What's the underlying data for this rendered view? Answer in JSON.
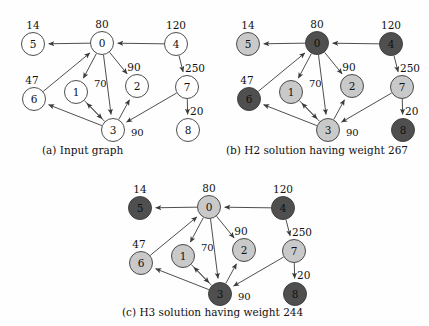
{
  "figure": {
    "background": "#fefefe",
    "stroke": "#3a3a3a",
    "fill_white": "#ffffff",
    "fill_light": "#c9c9c9",
    "fill_dark": "#4f4f4f"
  },
  "panels": [
    {
      "id": "a",
      "caption": "(a) Input graph",
      "nodes": [
        {
          "id": "5",
          "label": "5",
          "weight": "14",
          "shade": "white",
          "x": 33,
          "y": 42
        },
        {
          "id": "0",
          "label": "0",
          "weight": "80",
          "shade": "white",
          "x": 102,
          "y": 41
        },
        {
          "id": "4",
          "label": "4",
          "weight": "120",
          "shade": "white",
          "x": 176,
          "y": 42
        },
        {
          "id": "6",
          "label": "6",
          "weight": "47",
          "shade": "white",
          "x": 34,
          "y": 97
        },
        {
          "id": "1",
          "label": "1",
          "weight": "",
          "shade": "white",
          "x": 76,
          "y": 90
        },
        {
          "id": "2",
          "label": "2",
          "weight": "90",
          "shade": "white",
          "x": 137,
          "y": 84
        },
        {
          "id": "7",
          "label": "7",
          "weight": "250",
          "shade": "white",
          "x": 187,
          "y": 85
        },
        {
          "id": "3",
          "label": "3",
          "weight": "",
          "shade": "white",
          "x": 113,
          "y": 128
        },
        {
          "id": "8",
          "label": "8",
          "weight": "20",
          "shade": "white",
          "x": 188,
          "y": 128
        }
      ],
      "edge_labels": [
        {
          "text": "70",
          "x": 94,
          "y": 85
        },
        {
          "text": "90",
          "x": 131,
          "y": 134
        }
      ]
    },
    {
      "id": "b",
      "caption": "(b) H2 solution having weight 267",
      "nodes": [
        {
          "id": "5",
          "label": "5",
          "weight": "14",
          "shade": "light",
          "x": 33,
          "y": 42
        },
        {
          "id": "0",
          "label": "0",
          "weight": "80",
          "shade": "dark",
          "x": 102,
          "y": 41
        },
        {
          "id": "4",
          "label": "4",
          "weight": "120",
          "shade": "dark",
          "x": 176,
          "y": 42
        },
        {
          "id": "6",
          "label": "6",
          "weight": "47",
          "shade": "dark",
          "x": 34,
          "y": 97
        },
        {
          "id": "1",
          "label": "1",
          "weight": "",
          "shade": "light",
          "x": 76,
          "y": 90
        },
        {
          "id": "2",
          "label": "2",
          "weight": "90",
          "shade": "light",
          "x": 137,
          "y": 84
        },
        {
          "id": "7",
          "label": "7",
          "weight": "250",
          "shade": "light",
          "x": 187,
          "y": 85
        },
        {
          "id": "3",
          "label": "3",
          "weight": "",
          "shade": "light",
          "x": 113,
          "y": 128
        },
        {
          "id": "8",
          "label": "8",
          "weight": "20",
          "shade": "dark",
          "x": 188,
          "y": 128
        }
      ],
      "edge_labels": [
        {
          "text": "70",
          "x": 94,
          "y": 85
        },
        {
          "text": "90",
          "x": 131,
          "y": 134
        }
      ]
    },
    {
      "id": "c",
      "caption": "(c) H3 solution having weight 244",
      "nodes": [
        {
          "id": "5",
          "label": "5",
          "weight": "14",
          "shade": "dark",
          "x": 33,
          "y": 42
        },
        {
          "id": "0",
          "label": "0",
          "weight": "80",
          "shade": "light",
          "x": 102,
          "y": 41
        },
        {
          "id": "4",
          "label": "4",
          "weight": "120",
          "shade": "dark",
          "x": 176,
          "y": 42
        },
        {
          "id": "6",
          "label": "6",
          "weight": "47",
          "shade": "light",
          "x": 34,
          "y": 97
        },
        {
          "id": "1",
          "label": "1",
          "weight": "",
          "shade": "light",
          "x": 76,
          "y": 90
        },
        {
          "id": "2",
          "label": "2",
          "weight": "90",
          "shade": "light",
          "x": 137,
          "y": 84
        },
        {
          "id": "7",
          "label": "7",
          "weight": "250",
          "shade": "light",
          "x": 187,
          "y": 85
        },
        {
          "id": "3",
          "label": "3",
          "weight": "",
          "shade": "dark",
          "x": 113,
          "y": 128
        },
        {
          "id": "8",
          "label": "8",
          "weight": "20",
          "shade": "dark",
          "x": 188,
          "y": 128
        }
      ],
      "edge_labels": [
        {
          "text": "70",
          "x": 94,
          "y": 85
        },
        {
          "text": "90",
          "x": 131,
          "y": 134
        }
      ]
    }
  ],
  "edges": [
    {
      "from": "0",
      "to": "5"
    },
    {
      "from": "4",
      "to": "0"
    },
    {
      "from": "6",
      "to": "0"
    },
    {
      "from": "0",
      "to": "1"
    },
    {
      "from": "0",
      "to": "2"
    },
    {
      "from": "0",
      "to": "3"
    },
    {
      "from": "4",
      "to": "7"
    },
    {
      "from": "7",
      "to": "8"
    },
    {
      "from": "7",
      "to": "3"
    },
    {
      "from": "3",
      "to": "6"
    },
    {
      "from": "3",
      "to": "1"
    },
    {
      "from": "3",
      "to": "2"
    },
    {
      "from": "1",
      "to": "3"
    }
  ],
  "layout": {
    "panel_a": {
      "left": 0,
      "top": 2
    },
    "panel_b": {
      "left": 215,
      "top": 2
    },
    "panel_c": {
      "left": 107,
      "top": 166
    },
    "caption_a": {
      "left": 42,
      "top": 144
    },
    "caption_b": {
      "left": 226,
      "top": 144
    },
    "caption_c": {
      "left": 122,
      "top": 306
    }
  }
}
